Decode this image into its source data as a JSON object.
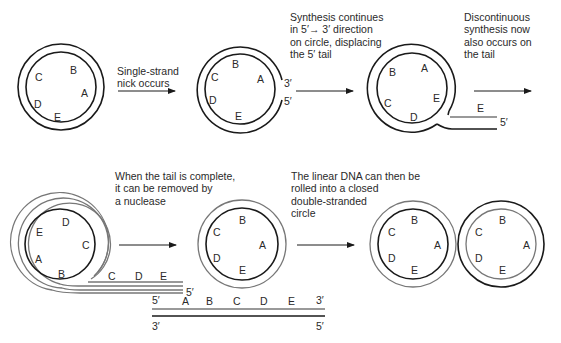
{
  "captions": {
    "step1": "Single-strand\nnick occurs",
    "step2": "Synthesis continues\nin 5′→ 3′ direction\non circle, displacing\nthe 5′ tail",
    "step3": "Discontinuous\nsynthesis now\nalso occurs on\nthe tail",
    "step4": "When the tail is complete,\nit can be removed by\na nuclease",
    "step5": "The linear DNA can then be\nrolled into a closed\ndouble-stranded\ncircle"
  },
  "circles": {
    "c1": {
      "A": "A",
      "B": "B",
      "C": "C",
      "D": "D",
      "E": "E"
    },
    "c2": {
      "A": "A",
      "B": "B",
      "C": "C",
      "D": "D",
      "E": "E",
      "end3": "3′",
      "end5": "5′"
    },
    "c3": {
      "A": "A",
      "B": "B",
      "C": "C",
      "D": "D",
      "E": "E",
      "tailE": "E",
      "end5": "5′"
    },
    "c4": {
      "E": "E",
      "D": "D",
      "C": "C",
      "A": "A",
      "B": "B",
      "tailC": "C",
      "tailD": "D",
      "tailE": "E",
      "end5": "5′"
    },
    "c5": {
      "A": "A",
      "B": "B",
      "C": "C",
      "D": "D",
      "E": "E"
    },
    "c6": {
      "A": "A",
      "B": "B",
      "C": "C",
      "D": "D",
      "E": "E"
    },
    "c7": {
      "A": "A",
      "B": "B",
      "C": "C",
      "D": "D",
      "E": "E"
    }
  },
  "linear": {
    "top5": "5′",
    "top3": "3′",
    "bottom3": "3′",
    "bottom5": "5′",
    "labels": [
      "A",
      "B",
      "C",
      "D",
      "E"
    ]
  },
  "colors": {
    "new_strand": "#777777",
    "template_strand": "#1a1a1a",
    "background": "#ffffff"
  }
}
